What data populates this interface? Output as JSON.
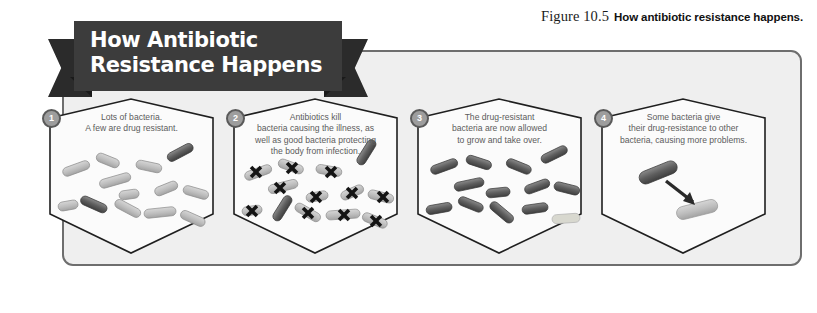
{
  "figure": {
    "number_label": "Figure 10.5",
    "caption": "How antibiotic resistance happens."
  },
  "banner": {
    "line1": "How Antibiotic",
    "line2": "Resistance Happens",
    "background_color": "#3c3c3c",
    "text_color": "#ffffff"
  },
  "panel": {
    "background_color": "#efefef",
    "border_color": "#6e6e6e"
  },
  "colors": {
    "susceptible_bacteria": "#b8b8b8",
    "resistant_bacteria": "#6e6e6e",
    "kill_mark": "#1a1a1a",
    "badge_fill": "#9d9d9d",
    "badge_border": "#5a5a5a",
    "body_text": "#5c5c5c"
  },
  "steps": [
    {
      "number": "1",
      "text_lines": [
        "Lots of bacteria.",
        "A few are drug resistant."
      ],
      "icon": "bacteria-cluster-icon"
    },
    {
      "number": "2",
      "text_lines": [
        "Antibiotics kill",
        "bacteria causing the illness, as",
        "well as good bacteria protecting",
        "the body from infection."
      ],
      "icon": "bacteria-killed-x-icon"
    },
    {
      "number": "3",
      "text_lines": [
        "The drug-resistant",
        "bacteria are now allowed",
        "to grow and take over."
      ],
      "icon": "resistant-bacteria-cluster-icon"
    },
    {
      "number": "4",
      "text_lines": [
        "Some bacteria give",
        "their drug-resistance to other",
        "bacteria, causing more problems."
      ],
      "icon": "gene-transfer-arrow-icon"
    }
  ]
}
